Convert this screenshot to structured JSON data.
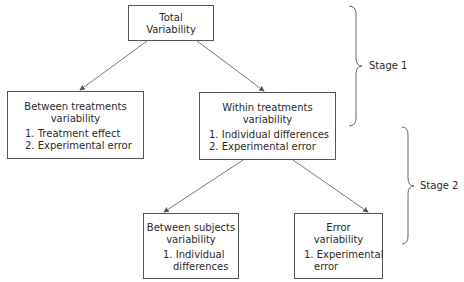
{
  "nodes": {
    "total": {
      "title": [
        "Total",
        "Variability"
      ]
    },
    "between_treatments": {
      "title": [
        "Between treatments",
        "variability"
      ],
      "items": [
        "1. Treatment effect",
        "2. Experimental error"
      ]
    },
    "within_treatments": {
      "title": [
        "Within treatments",
        "variability"
      ],
      "items": [
        "1. Individual differences",
        "2. Experimental error"
      ]
    },
    "between_subjects": {
      "title": [
        "Between subjects",
        "variability"
      ],
      "items": [
        "1. Individual",
        "differences"
      ]
    },
    "error": {
      "title": [
        "Error",
        "variability"
      ],
      "items": [
        "1. Experimental",
        "error"
      ]
    }
  },
  "stages": {
    "stage1": "Stage 1",
    "stage2": "Stage 2"
  },
  "colors": {
    "line": "#555555",
    "text": "#2a2a2a"
  }
}
